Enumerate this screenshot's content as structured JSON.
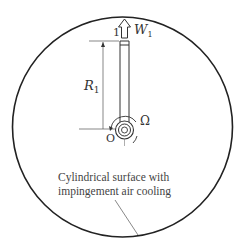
{
  "diagram": {
    "labels": {
      "station": "1",
      "velocity": "W",
      "velocity_sub": "1",
      "radius": "R",
      "radius_sub": "1",
      "rotation": "Ω",
      "origin": "O"
    },
    "caption_line1": "Cylindrical surface with",
    "caption_line2": "impingement air cooling",
    "colors": {
      "stroke": "#222222",
      "text": "#444444"
    }
  }
}
